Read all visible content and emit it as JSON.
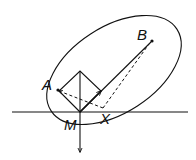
{
  "diagram": {
    "labels": {
      "A": "A",
      "B": "B",
      "M": "M",
      "X": "X"
    },
    "colors": {
      "stroke": "#111111",
      "background": "#ffffff"
    },
    "elements": [
      "ellipse (rotated)",
      "horizontal line through M",
      "square with vertex at M",
      "arrow from M downward",
      "solid line from M to B with arrow",
      "dashed line X to A with arrow",
      "dashed line X to B",
      "dashed line from M to A"
    ]
  }
}
